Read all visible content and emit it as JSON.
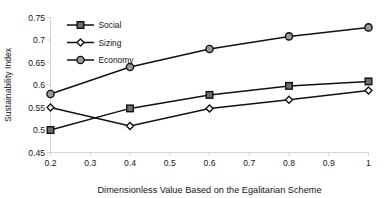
{
  "chart_data": {
    "type": "line",
    "title": "",
    "xlabel": "Dimensionless Value Based on the Egalitarian Scheme",
    "ylabel": "Sustainability Index",
    "xlim": [
      0.2,
      1.0
    ],
    "ylim": [
      0.45,
      0.75
    ],
    "xticks": [
      "0.2",
      "0.3",
      "0.4",
      "0.5",
      "0.6",
      "0.7",
      "0.8",
      "0.9",
      "1"
    ],
    "xtick_values": [
      0.2,
      0.3,
      0.4,
      0.5,
      0.6,
      0.7,
      0.8,
      0.9,
      1.0
    ],
    "yticks": [
      "0.45",
      "0.5",
      "0.55",
      "0.6",
      "0.65",
      "0.7",
      "0.75"
    ],
    "ytick_values": [
      0.45,
      0.5,
      0.55,
      0.6,
      0.65,
      0.7,
      0.75
    ],
    "grid": false,
    "legend_position": "upper-left-inside",
    "x": [
      0.2,
      0.4,
      0.6,
      0.8,
      1.0
    ],
    "series": [
      {
        "name": "Social",
        "marker": "square",
        "marker_fill": "#6e6e6e",
        "line_color": "#111111",
        "values": [
          0.5,
          0.548,
          0.578,
          0.598,
          0.608
        ]
      },
      {
        "name": "Sizing",
        "marker": "diamond",
        "marker_fill": "#ffffff",
        "line_color": "#111111",
        "values": [
          0.55,
          0.509,
          0.548,
          0.567,
          0.588
        ]
      },
      {
        "name": "Economy",
        "marker": "circle",
        "marker_fill": "#9a9a9a",
        "line_color": "#111111",
        "values": [
          0.58,
          0.64,
          0.68,
          0.708,
          0.728
        ]
      }
    ]
  },
  "legend": {
    "items": [
      {
        "label": "Social"
      },
      {
        "label": "Sizing"
      },
      {
        "label": "Economy"
      }
    ]
  },
  "colors": {
    "axis": "#d3d3d3",
    "line": "#111111",
    "text": "#151515",
    "background": "#ffffff"
  }
}
